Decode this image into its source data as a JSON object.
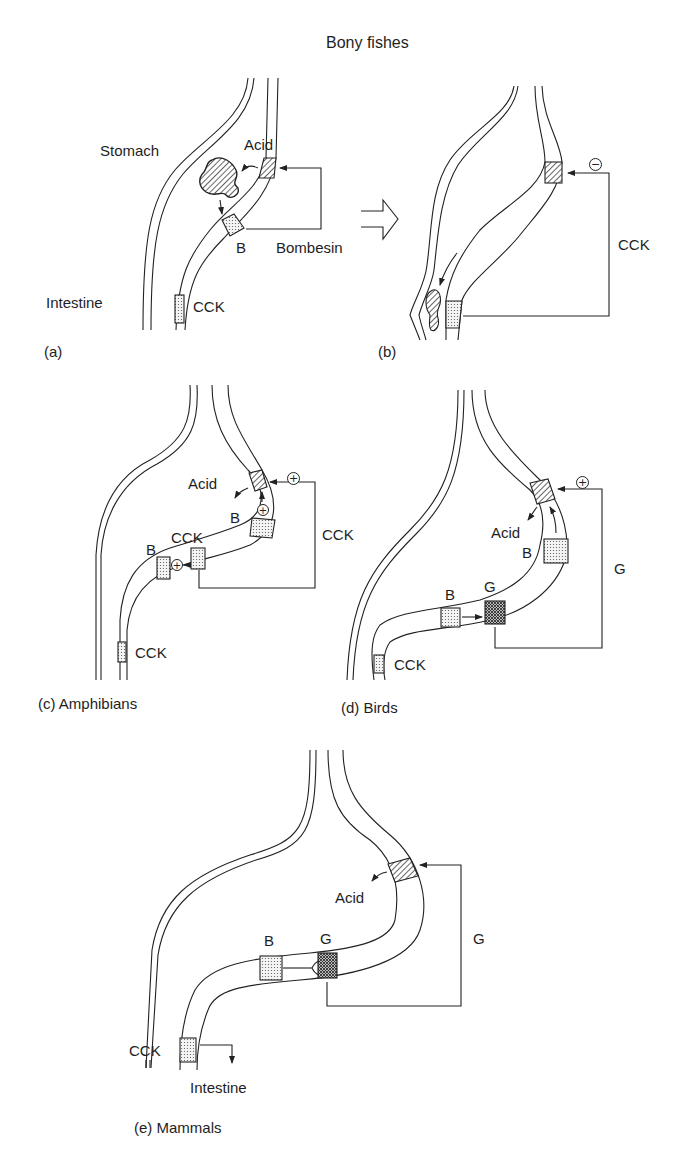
{
  "figure": {
    "title": "Bony fishes",
    "transition_arrow": "open-arrow-right",
    "colors": {
      "ink": "#1e1e1e",
      "background": "#ffffff"
    },
    "panels": [
      {
        "id": "a",
        "caption": "(a)",
        "labels": {
          "stomach": "Stomach",
          "intestine": "Intestine",
          "acid": "Acid",
          "b_cell": "B",
          "bombesin": "Bombesin",
          "cck": "CCK"
        }
      },
      {
        "id": "b",
        "caption": "(b)",
        "labels": {
          "cck_pathway": "CCK",
          "sign": "−"
        }
      },
      {
        "id": "c",
        "caption": "(c) Amphibians",
        "labels": {
          "acid": "Acid",
          "b_upper": "B",
          "cck_mid": "CCK",
          "b_lower": "B",
          "cck_pathway": "CCK",
          "cck_low": "CCK",
          "sign_top": "+",
          "sign_inner": "+",
          "sign_local": "+"
        }
      },
      {
        "id": "d",
        "caption": "(d) Birds",
        "labels": {
          "acid": "Acid",
          "b_upper": "B",
          "b_lower": "B",
          "g_cell": "G",
          "g_pathway": "G",
          "cck_low": "CCK",
          "sign_top": "+"
        }
      },
      {
        "id": "e",
        "caption": "(e) Mammals",
        "labels": {
          "acid": "Acid",
          "b_cell": "B",
          "g_cell": "G",
          "g_pathway": "G",
          "cck": "CCK",
          "intestine": "Intestine"
        }
      }
    ]
  }
}
